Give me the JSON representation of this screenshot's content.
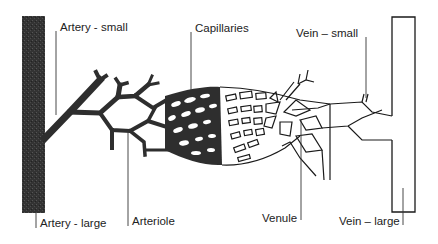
{
  "diagram": {
    "labels": {
      "artery_small": "Artery - small",
      "capillaries": "Capillaries",
      "vein_small": "Vein – small",
      "artery_large": "Artery - large",
      "arteriole": "Arteriole",
      "venule": "Venule",
      "vein_large": "Vein – large"
    },
    "colors": {
      "artery_fill": "#2e2e2e",
      "vein_stroke": "#1a1a1a",
      "background": "#ffffff",
      "leader_line": "#333333"
    }
  }
}
